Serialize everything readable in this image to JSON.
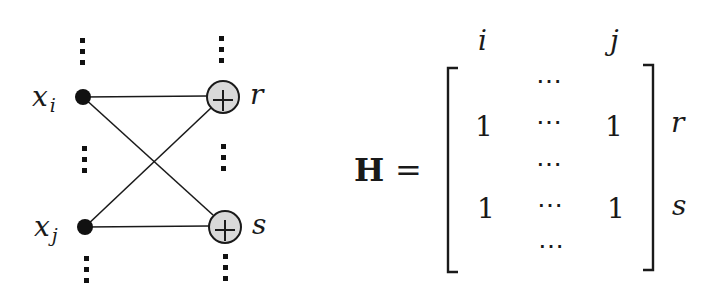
{
  "graph": {
    "variable_nodes": [
      {
        "id": "xi",
        "label": "x",
        "subscript": "i"
      },
      {
        "id": "xj",
        "label": "x",
        "subscript": "j"
      }
    ],
    "check_nodes": [
      {
        "id": "r",
        "label": "r",
        "symbol": "+"
      },
      {
        "id": "s",
        "label": "s",
        "symbol": "+"
      }
    ],
    "edges": [
      [
        "xi",
        "r"
      ],
      [
        "xi",
        "s"
      ],
      [
        "xj",
        "r"
      ],
      [
        "xj",
        "s"
      ]
    ],
    "colors": {
      "check_fill": "#d9d9d9",
      "stroke": "#1a1a1a",
      "variable_fill": "#111111"
    }
  },
  "matrix": {
    "name": "H",
    "equals": "=",
    "column_labels": {
      "i": "i",
      "j": "j"
    },
    "row_labels": {
      "r": "r",
      "s": "s"
    },
    "rows": [
      {
        "left": "",
        "mid": "⋯",
        "right": ""
      },
      {
        "left": "1",
        "mid": "⋯",
        "right": "1"
      },
      {
        "left": "",
        "mid": "⋯",
        "right": ""
      },
      {
        "left": "1",
        "mid": "⋯",
        "right": "1"
      },
      {
        "left": "",
        "mid": "⋯",
        "right": ""
      }
    ]
  }
}
